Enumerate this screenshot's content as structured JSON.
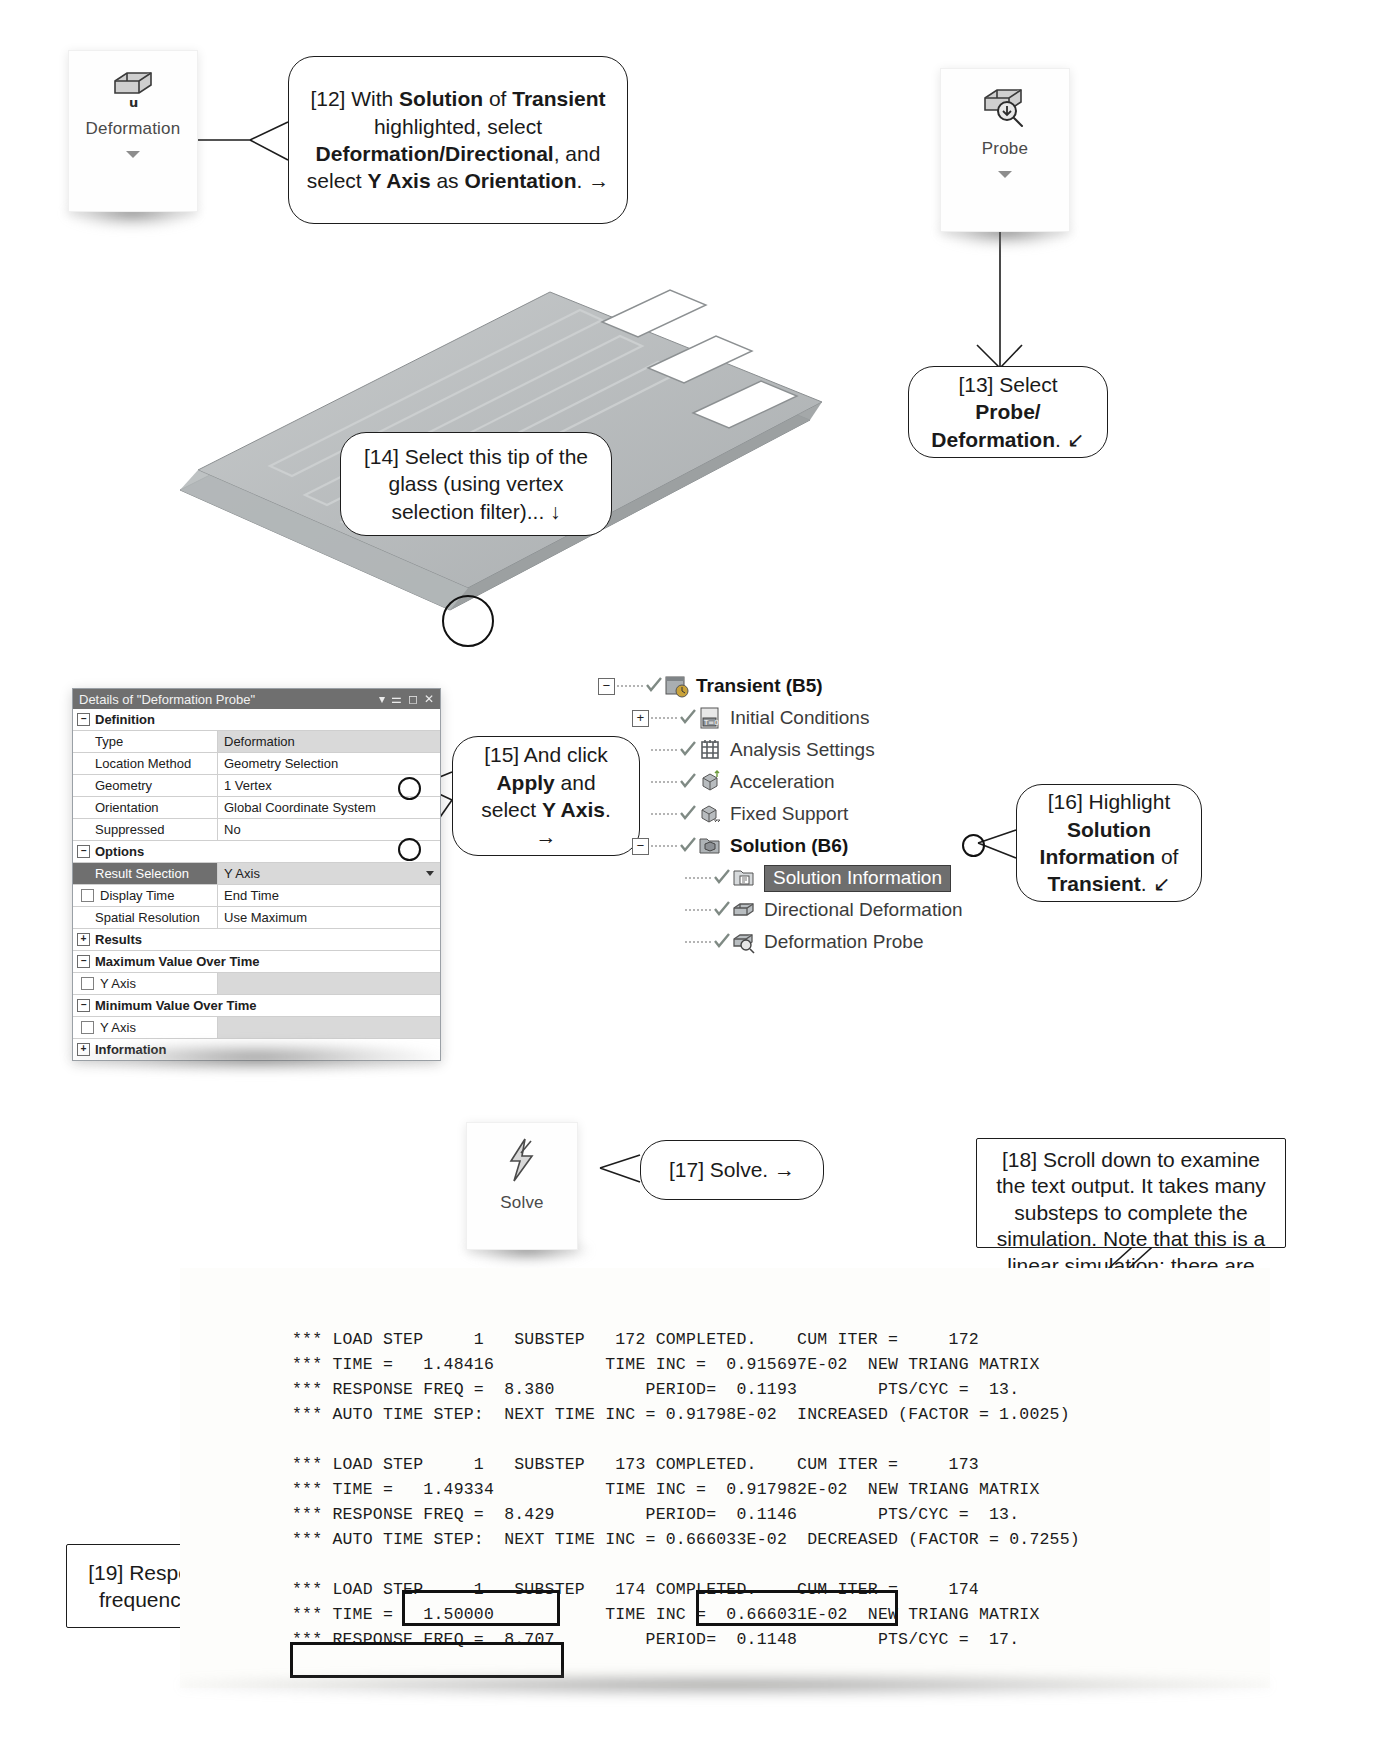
{
  "ribbon_buttons": [
    {
      "name": "deformation",
      "label": "Deformation",
      "icon": "deformation-cube-u-icon",
      "has_caret": true
    },
    {
      "name": "probe",
      "label": "Probe",
      "icon": "probe-cube-magnifier-icon",
      "has_caret": true
    },
    {
      "name": "solve",
      "label": "Solve",
      "icon": "lightning-bolt-icon",
      "has_caret": false
    }
  ],
  "callouts": [
    {
      "id": "12",
      "tag": "[12]",
      "shape": "rounded",
      "segments": [
        {
          "t": "[12] With ",
          "b": false
        },
        {
          "t": "Solution",
          "b": true
        },
        {
          "t": " of ",
          "b": false
        },
        {
          "t": "Transient",
          "b": true
        },
        {
          "t": " highlighted, select ",
          "b": false
        },
        {
          "t": "Deformation/Directional",
          "b": true
        },
        {
          "t": ", and select ",
          "b": false
        },
        {
          "t": "Y Axis",
          "b": true
        },
        {
          "t": " as ",
          "b": false
        },
        {
          "t": "Orientation",
          "b": true
        },
        {
          "t": ". →",
          "b": false
        }
      ]
    },
    {
      "id": "13",
      "tag": "[13]",
      "shape": "rounded",
      "segments": [
        {
          "t": "[13] Select ",
          "b": false
        },
        {
          "t": "Probe/ Deformation",
          "b": true
        },
        {
          "t": ". ↙",
          "b": false
        }
      ]
    },
    {
      "id": "14",
      "tag": "[14]",
      "shape": "rounded",
      "segments": [
        {
          "t": "[14] Select this tip of the glass (using vertex selection filter)... ↓",
          "b": false
        }
      ]
    },
    {
      "id": "15",
      "tag": "[15]",
      "shape": "rounded",
      "segments": [
        {
          "t": "[15] And click ",
          "b": false
        },
        {
          "t": "Apply",
          "b": true
        },
        {
          "t": " and select ",
          "b": false
        },
        {
          "t": "Y Axis",
          "b": true
        },
        {
          "t": ". →",
          "b": false
        }
      ]
    },
    {
      "id": "16",
      "tag": "[16]",
      "shape": "rounded",
      "segments": [
        {
          "t": "[16] Highlight ",
          "b": false
        },
        {
          "t": "Solution Information",
          "b": true
        },
        {
          "t": " of ",
          "b": false
        },
        {
          "t": "Transient",
          "b": true
        },
        {
          "t": ". ↙",
          "b": false
        }
      ]
    },
    {
      "id": "17",
      "tag": "[17]",
      "shape": "rounded",
      "segments": [
        {
          "t": "[17] Solve. →",
          "b": false
        }
      ]
    },
    {
      "id": "18",
      "tag": "[18]",
      "shape": "square",
      "segments": [
        {
          "t": "[18] Scroll down to examine the text output.  It takes many substeps to complete the simulation.  Note that this is a linear simulation; there are no nonlinearities involved; each substep needs exactly one iteration. ↙",
          "b": false
        }
      ]
    },
    {
      "id": "19",
      "tag": "[19]",
      "shape": "square",
      "segments": [
        {
          "t": "[19] Response frequency. #",
          "b": false
        }
      ]
    }
  ],
  "details_panel": {
    "title": "Details of \"Deformation Probe\"",
    "title_icons": [
      "chevron-down-icon",
      "pin-icon",
      "maximize-icon",
      "close-icon"
    ],
    "rows": [
      {
        "type": "group",
        "expander": "−",
        "label": "Definition"
      },
      {
        "type": "prop",
        "key": "Type",
        "value": "Deformation",
        "shaded": true
      },
      {
        "type": "prop",
        "key": "Location Method",
        "value": "Geometry Selection",
        "shaded": false
      },
      {
        "type": "prop",
        "key": "Geometry",
        "value": "1 Vertex",
        "shaded": false
      },
      {
        "type": "prop",
        "key": "Orientation",
        "value": "Global Coordinate System",
        "shaded": false
      },
      {
        "type": "prop",
        "key": "Suppressed",
        "value": "No",
        "shaded": false
      },
      {
        "type": "group",
        "expander": "−",
        "label": "Options"
      },
      {
        "type": "select",
        "key": "Result Selection",
        "value": "Y Axis",
        "selected": true
      },
      {
        "type": "check",
        "key": "Display Time",
        "value": "End Time",
        "checked": false
      },
      {
        "type": "prop",
        "key": "Spatial Resolution",
        "value": "Use Maximum",
        "shaded": false
      },
      {
        "type": "group",
        "expander": "+",
        "label": "Results"
      },
      {
        "type": "group",
        "expander": "−",
        "label": "Maximum Value Over Time"
      },
      {
        "type": "check",
        "key": "Y Axis",
        "value": "",
        "checked": false
      },
      {
        "type": "group",
        "expander": "−",
        "label": "Minimum Value Over Time"
      },
      {
        "type": "check",
        "key": "Y Axis",
        "value": "",
        "checked": false
      },
      {
        "type": "group",
        "expander": "+",
        "label": "Information"
      }
    ]
  },
  "tree": {
    "items": [
      {
        "label": "Transient (B5)",
        "indent": 0,
        "expander": "−",
        "bold": true,
        "selected": false,
        "icon": "transient-clock-icon"
      },
      {
        "label": "Initial Conditions",
        "indent": 1,
        "expander": "+",
        "bold": false,
        "selected": false,
        "icon": "initial-conditions-icon"
      },
      {
        "label": "Analysis Settings",
        "indent": 1,
        "expander": "",
        "bold": false,
        "selected": false,
        "icon": "analysis-settings-icon"
      },
      {
        "label": "Acceleration",
        "indent": 1,
        "expander": "",
        "bold": false,
        "selected": false,
        "icon": "acceleration-icon"
      },
      {
        "label": "Fixed Support",
        "indent": 1,
        "expander": "",
        "bold": false,
        "selected": false,
        "icon": "fixed-support-icon"
      },
      {
        "label": "Solution (B6)",
        "indent": 1,
        "expander": "−",
        "bold": true,
        "selected": false,
        "icon": "solution-folder-icon"
      },
      {
        "label": "Solution Information",
        "indent": 2,
        "expander": "",
        "bold": false,
        "selected": true,
        "icon": "solution-information-icon"
      },
      {
        "label": "Directional Deformation",
        "indent": 2,
        "expander": "",
        "bold": false,
        "selected": false,
        "icon": "directional-deformation-icon"
      },
      {
        "label": "Deformation Probe",
        "indent": 2,
        "expander": "",
        "bold": false,
        "selected": false,
        "icon": "deformation-probe-icon"
      }
    ]
  },
  "solver_output": {
    "lines": [
      "*** LOAD STEP     1   SUBSTEP   172 COMPLETED.    CUM ITER =     172",
      "*** TIME =   1.48416           TIME INC =  0.915697E-02  NEW TRIANG MATRIX",
      "*** RESPONSE FREQ =  8.380         PERIOD=  0.1193        PTS/CYC =  13.",
      "*** AUTO TIME STEP:  NEXT TIME INC = 0.91798E-02  INCREASED (FACTOR = 1.0025)",
      "",
      "*** LOAD STEP     1   SUBSTEP   173 COMPLETED.    CUM ITER =     173",
      "*** TIME =   1.49334           TIME INC =  0.917982E-02  NEW TRIANG MATRIX",
      "*** RESPONSE FREQ =  8.429         PERIOD=  0.1146        PTS/CYC =  13.",
      "*** AUTO TIME STEP:  NEXT TIME INC = 0.666033E-02  DECREASED (FACTOR = 0.7255)",
      "",
      "*** LOAD STEP     1   SUBSTEP   174 COMPLETED.    CUM ITER =     174",
      "*** TIME =   1.50000           TIME INC =  0.666031E-02  NEW TRIANG MATRIX",
      "*** RESPONSE FREQ =  8.707         PERIOD=  0.1148        PTS/CYC =  17."
    ],
    "highlighted_fragments": [
      "SUBSTEP   174",
      "CUM ITER =     174",
      "*** RESPONSE FREQ =  8.707"
    ]
  },
  "colors": {
    "callout_border": "#1d1d1d",
    "panel_titlebar": "#6f6f6f",
    "tree_selection": "#6e6e6e",
    "geometry_gray": "#b9bcbd",
    "page_background": "#ffffff"
  },
  "geometry": {
    "name": "glass-plate-3d-view",
    "description": "Isometric shaded gray laminated glass plate with three rectangular cut-outs"
  }
}
